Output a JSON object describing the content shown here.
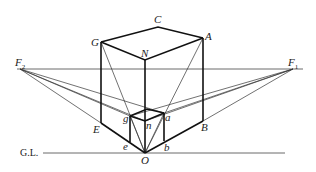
{
  "diagram": {
    "labels": {
      "F2": "F",
      "F2_sub": "2",
      "F1": "F",
      "F1_sub": "1",
      "C": "C",
      "G": "G",
      "A": "A",
      "N": "N",
      "E": "E",
      "B": "B",
      "O": "O",
      "g": "g",
      "n": "n",
      "a": "a",
      "e": "e",
      "b": "b",
      "ground_line": "G.L."
    },
    "points": {
      "F2": [
        20,
        69
      ],
      "F1": [
        293,
        69
      ],
      "G": [
        101,
        42
      ],
      "C": [
        158,
        27
      ],
      "A": [
        203,
        38
      ],
      "N": [
        145,
        60
      ],
      "E": [
        101,
        123
      ],
      "B": [
        203,
        121
      ],
      "O": [
        145,
        153
      ],
      "g": [
        130,
        116
      ],
      "n": [
        145,
        121
      ],
      "a": [
        164,
        113
      ],
      "e": [
        130,
        142
      ],
      "b": [
        164,
        141
      ]
    },
    "colors": {
      "line": "#111111",
      "thin_line": "#333333",
      "background": "#ffffff"
    }
  }
}
